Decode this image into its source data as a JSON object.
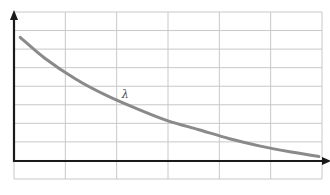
{
  "chart_data": {
    "type": "line",
    "title": "",
    "xlabel": "",
    "ylabel": "",
    "grid": true,
    "grid_columns": 6,
    "grid_rows": 9,
    "annotations": [
      {
        "text": "λ",
        "x": 0.35,
        "y": 0.42
      }
    ],
    "series": [
      {
        "name": "λ",
        "description": "decreasing exponential decay curve",
        "x": [
          0.02,
          0.1,
          0.2,
          0.3,
          0.4,
          0.5,
          0.6,
          0.7,
          0.8,
          0.9,
          0.99
        ],
        "y": [
          0.83,
          0.69,
          0.55,
          0.44,
          0.35,
          0.27,
          0.21,
          0.15,
          0.1,
          0.06,
          0.03
        ]
      }
    ],
    "xlim": [
      0,
      1
    ],
    "ylim": [
      0,
      1
    ]
  },
  "colors": {
    "grid": "#c8c8c8",
    "axis": "#1a1a1a",
    "curve": "#8a8a8a",
    "label": "#444444"
  },
  "labels": {
    "curve_label": "λ"
  }
}
